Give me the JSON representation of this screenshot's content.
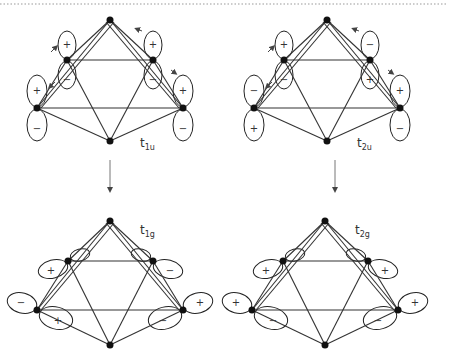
{
  "figure": {
    "panels": [
      {
        "id": "t1u",
        "label_main": "t",
        "label_sub": "1u",
        "position": "top-left",
        "orbital_type": "p-vertical",
        "signs": {
          "back_left": [
            "+",
            "−"
          ],
          "back_right": [
            "+",
            "−"
          ],
          "front_left": [
            "+",
            "−"
          ],
          "front_right": [
            "+",
            "−"
          ]
        },
        "has_motion_arrows": true
      },
      {
        "id": "t2u",
        "label_main": "t",
        "label_sub": "2u",
        "position": "top-right",
        "orbital_type": "p-vertical",
        "signs": {
          "back_left": [
            "+",
            "−"
          ],
          "back_right": [
            "−",
            "+"
          ],
          "front_left": [
            "−",
            "+"
          ],
          "front_right": [
            "+",
            "−"
          ]
        },
        "has_motion_arrows": true
      },
      {
        "id": "t1g",
        "label_main": "t",
        "label_sub": "1g",
        "position": "bottom-left",
        "orbital_type": "p-tangential",
        "signs": {
          "back_left": [
            "+",
            "−"
          ],
          "back_right": [
            "−",
            "+"
          ],
          "front_left": [
            "−",
            "+"
          ],
          "front_right": [
            "+",
            "−"
          ]
        }
      },
      {
        "id": "t2g",
        "label_main": "t",
        "label_sub": "2g",
        "position": "bottom-right",
        "orbital_type": "p-tangential",
        "signs": {
          "back_left": [
            "+",
            "−"
          ],
          "back_right": [
            "+",
            "−"
          ],
          "front_left": [
            "+",
            "−"
          ],
          "front_right": [
            "+",
            "−"
          ]
        }
      }
    ],
    "arrows": [
      {
        "from": "t1u",
        "to": "t1g"
      },
      {
        "from": "t2u",
        "to": "t2g"
      }
    ]
  },
  "labels": {
    "t1u": {
      "main": "t",
      "sub": "1u"
    },
    "t2u": {
      "main": "t",
      "sub": "2u"
    },
    "t1g": {
      "main": "t",
      "sub": "1g"
    },
    "t2g": {
      "main": "t",
      "sub": "2g"
    }
  },
  "signs": {
    "plus": "+",
    "minus": "−"
  },
  "colors": {
    "line": "#333333",
    "atom": "#111111",
    "background": "#ffffff"
  }
}
